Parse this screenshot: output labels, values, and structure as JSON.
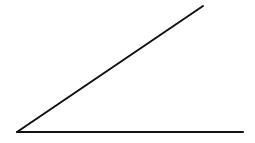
{
  "diagram": {
    "type": "angle",
    "background": "#ffffff",
    "stroke": "#111111",
    "stroke_width": 2,
    "vertex": [
      17,
      132
    ],
    "rays": [
      {
        "name": "horizontal-ray",
        "end": [
          243,
          132
        ]
      },
      {
        "name": "inclined-ray",
        "end": [
          203,
          6
        ]
      }
    ]
  }
}
